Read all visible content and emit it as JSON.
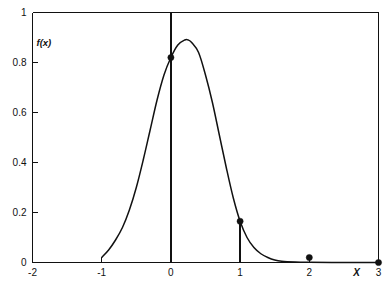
{
  "chart_data": {
    "type": "line",
    "title": "",
    "subtitle": "",
    "xlabel": "X",
    "ylabel": "f(x)",
    "xlim": [
      -2,
      3
    ],
    "ylim": [
      0,
      1
    ],
    "grid": false,
    "legend": "none",
    "x_ticks": [
      "-2",
      "-1",
      "0",
      "1",
      "2",
      "3"
    ],
    "x_tick_values": [
      -2,
      -1,
      0,
      1,
      2,
      3
    ],
    "y_ticks": [
      "0",
      "0.2",
      "0.4",
      "0.6",
      "0.8",
      "1"
    ],
    "y_tick_values": [
      0,
      0.2,
      0.4,
      0.6,
      0.8,
      1
    ],
    "series": [
      {
        "name": "f(x)",
        "type": "curve",
        "x": [
          -1.0,
          -0.9,
          -0.8,
          -0.7,
          -0.6,
          -0.5,
          -0.4,
          -0.3,
          -0.2,
          -0.1,
          0.0,
          0.1,
          0.2,
          0.25,
          0.3,
          0.4,
          0.5,
          0.6,
          0.7,
          0.8,
          0.9,
          1.0,
          1.1,
          1.2,
          1.3,
          1.4,
          1.5,
          1.6,
          1.8,
          2.0,
          2.5,
          3.0
        ],
        "y": [
          0.02,
          0.05,
          0.09,
          0.14,
          0.21,
          0.3,
          0.41,
          0.53,
          0.65,
          0.75,
          0.82,
          0.87,
          0.89,
          0.89,
          0.88,
          0.84,
          0.75,
          0.64,
          0.51,
          0.38,
          0.26,
          0.165,
          0.1,
          0.06,
          0.035,
          0.02,
          0.01,
          0.005,
          0.002,
          0.001,
          0.0,
          0.0
        ]
      },
      {
        "name": "marked-points",
        "type": "scatter",
        "x": [
          0,
          1,
          2,
          3
        ],
        "y": [
          0.82,
          0.165,
          0.02,
          0.0
        ]
      }
    ],
    "annotations": [
      {
        "label": "vertical line at x = 0",
        "x": 0,
        "y_from": 0,
        "y_to": 1.0
      },
      {
        "label": "stem at x = 1",
        "x": 1,
        "y_from": 0,
        "y_to": 0.165
      },
      {
        "label": "stem at x = 2",
        "x": 2,
        "y_from": 0,
        "y_to": 0.02
      }
    ]
  },
  "caption": {
    "text": ""
  }
}
